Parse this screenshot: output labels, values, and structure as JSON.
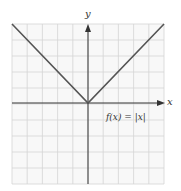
{
  "figure": {
    "x_axis_label": "x",
    "y_axis_label": "y",
    "function_label": "f(x) = |x|",
    "grid": {
      "columns": 10,
      "rows": 10,
      "x_range": [
        -5,
        5
      ],
      "y_range": [
        -5,
        5
      ]
    },
    "colors": {
      "grid": "#d0d0d0",
      "axis": "#333333",
      "curve": "#555555",
      "background": "#f7f7f7"
    }
  },
  "chart_data": {
    "type": "line",
    "title": "",
    "xlabel": "x",
    "ylabel": "y",
    "xlim": [
      -5,
      5
    ],
    "ylim": [
      -5,
      5
    ],
    "grid": true,
    "series": [
      {
        "name": "f(x) = |x|",
        "x": [
          -5,
          0,
          5
        ],
        "y": [
          5,
          0,
          5
        ]
      }
    ],
    "annotations": [
      "f(x) = |x|"
    ]
  }
}
